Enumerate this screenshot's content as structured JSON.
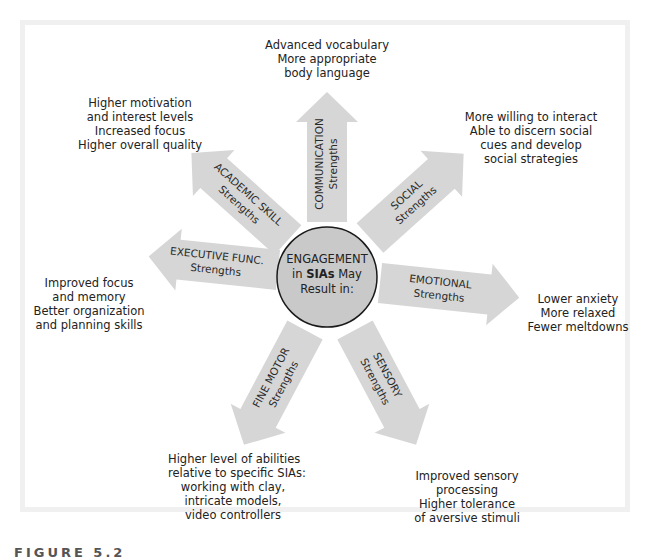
{
  "figure": {
    "caption": "FIGURE 5.2",
    "colors": {
      "arrow_fill": "#d6d6d6",
      "circle_fill": "#c9c9c9",
      "circle_stroke": "#1a1a1a",
      "frame": "#f0f0f0",
      "text": "#222222"
    }
  },
  "center": {
    "line1": "ENGAGEMENT",
    "line2_prefix": "in ",
    "line2_bold": "SIAs",
    "line2_suffix": " May",
    "line3": "Result in:"
  },
  "arrows": [
    {
      "id": "communication",
      "title": "COMMUNICATION",
      "subtitle": "Strengths",
      "outcomes": [
        "Advanced vocabulary",
        "More appropriate",
        "body language"
      ]
    },
    {
      "id": "social",
      "title": "SOCIAL",
      "subtitle": "Strengths",
      "outcomes": [
        "More willing to interact",
        "Able to discern social",
        "cues and develop",
        "social strategies"
      ]
    },
    {
      "id": "emotional",
      "title": "EMOTIONAL",
      "subtitle": "Strengths",
      "outcomes": [
        "Lower anxiety",
        "More relaxed",
        "Fewer meltdowns"
      ]
    },
    {
      "id": "sensory",
      "title": "SENSORY",
      "subtitle": "Strengths",
      "outcomes": [
        "Improved sensory",
        "processing",
        "Higher tolerance",
        "of aversive stimuli"
      ]
    },
    {
      "id": "fine-motor",
      "title": "FINE MOTOR",
      "subtitle": "Strengths",
      "outcomes": [
        "Higher level of abilities",
        "relative to specific SIAs:",
        "working with clay,",
        "intricate models,",
        "video controllers"
      ]
    },
    {
      "id": "executive-func",
      "title": "EXECUTIVE FUNC.",
      "subtitle": "Strengths",
      "outcomes": [
        "Improved focus",
        "and memory",
        "Better organization",
        "and planning skills"
      ]
    },
    {
      "id": "academic-skill",
      "title": "ACADEMIC SKILL",
      "subtitle": "Strengths",
      "outcomes": [
        "Higher motivation",
        "and interest levels",
        "Increased focus",
        "Higher overall quality"
      ]
    }
  ]
}
